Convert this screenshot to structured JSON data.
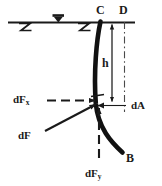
{
  "figure": {
    "background_color": "#ffffff",
    "ink_color": "#1a1a1a",
    "curve_color": "#111111"
  },
  "labels": {
    "point_c": "C",
    "point_d": "D",
    "point_b": "B",
    "depth_h": "h",
    "force_x": "dF",
    "force_x_sub": "x",
    "force_y": "dF",
    "force_y_sub": "y",
    "force_resultant": "dF",
    "area_element": "dA"
  },
  "symbols": {
    "free_surface_marker": "water-level-triangle",
    "surface_hatch_left": "z-squiggle",
    "surface_hatch_right": "z-squiggle"
  },
  "geometry": {
    "free_surface_y": 22,
    "free_surface_x_start": 8,
    "free_surface_x_end": 135,
    "curve_top_point": [
      100,
      22
    ],
    "curve_bottom_point": [
      122,
      152
    ],
    "action_point": [
      96,
      104
    ],
    "vertical_reference_x": 124,
    "dimension_line_x": 112
  }
}
